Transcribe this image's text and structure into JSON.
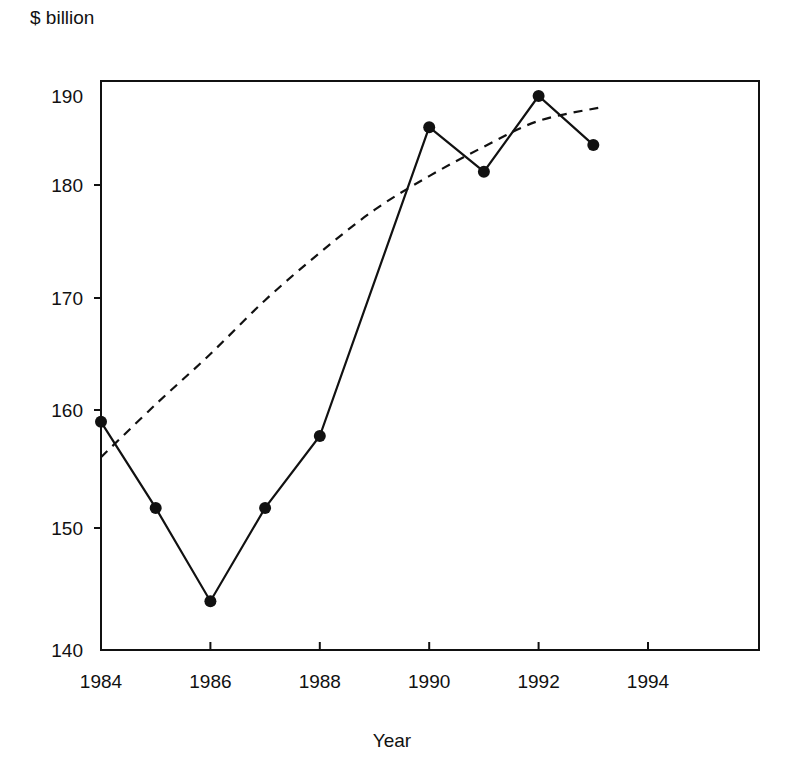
{
  "chart_data": {
    "type": "line",
    "title": "",
    "ylabel": "$ billion",
    "xlabel": "Year",
    "xlim": [
      1984,
      1996
    ],
    "ylim": [
      140,
      190
    ],
    "grid": false,
    "legend": null,
    "x_ticks": [
      1984,
      1986,
      1988,
      1990,
      1992,
      1994
    ],
    "y_ticks": [
      140,
      150,
      160,
      170,
      180,
      190
    ],
    "series": [
      {
        "name": "Actual",
        "style": "solid line with filled circle markers",
        "color": "#111111",
        "x": [
          1984,
          1985,
          1986,
          1987,
          1988,
          1990,
          1991,
          1992,
          1993
        ],
        "values": [
          159.0,
          151.7,
          144.0,
          151.7,
          157.8,
          186.5,
          181.5,
          190.0,
          184.5
        ]
      },
      {
        "name": "Trend",
        "style": "dashed smooth curve",
        "color": "#111111",
        "x": [
          1984,
          1985,
          1986,
          1987,
          1988,
          1989,
          1990,
          1991,
          1992,
          1993.2
        ],
        "values": [
          156.0,
          160.5,
          165.0,
          169.8,
          174.0,
          177.8,
          181.0,
          184.3,
          187.2,
          188.8
        ]
      }
    ]
  }
}
